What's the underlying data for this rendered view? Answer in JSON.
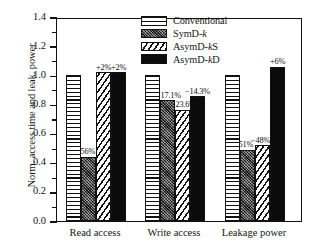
{
  "chart_data": {
    "type": "bar",
    "title": "",
    "xlabel": "",
    "ylabel": "Norm. access time and leak. power",
    "ylim": [
      0.0,
      1.4
    ],
    "ytick_step": 0.2,
    "yticks": [
      "0.0",
      "0.2",
      "0.4",
      "0.6",
      "0.8",
      "1.0",
      "1.2",
      "1.4"
    ],
    "grid": false,
    "legend_position": "upper-center",
    "categories": [
      "Read access",
      "Write access",
      "Leakage power"
    ],
    "series": [
      {
        "name": "Conventional",
        "pattern": "horizontal-lines",
        "values": [
          1.0,
          1.0,
          1.0
        ],
        "annotations": [
          "",
          "",
          ""
        ]
      },
      {
        "name": "SymD-k",
        "pattern": "dots",
        "values": [
          0.44,
          0.829,
          0.49
        ],
        "annotations": [
          "−56%",
          "−17.1%",
          "−51%"
        ]
      },
      {
        "name": "AsymD-kS",
        "pattern": "diagonal-hatch",
        "values": [
          1.02,
          0.764,
          0.52
        ],
        "annotations": [
          "+2%",
          "−23.6%",
          "−48%"
        ]
      },
      {
        "name": "AsymD-kD",
        "pattern": "solid-black",
        "values": [
          1.02,
          0.857,
          1.06
        ],
        "annotations": [
          "+2%",
          "−14.3%",
          "+6%"
        ]
      }
    ]
  },
  "legend": {
    "items": [
      {
        "label_main": "Conventional",
        "label_italic": "",
        "label_tail": ""
      },
      {
        "label_main": "SymD-",
        "label_italic": "k",
        "label_tail": ""
      },
      {
        "label_main": "AsymD-",
        "label_italic": "k",
        "label_tail": "S"
      },
      {
        "label_main": "AsymD-",
        "label_italic": "k",
        "label_tail": "D"
      }
    ]
  }
}
